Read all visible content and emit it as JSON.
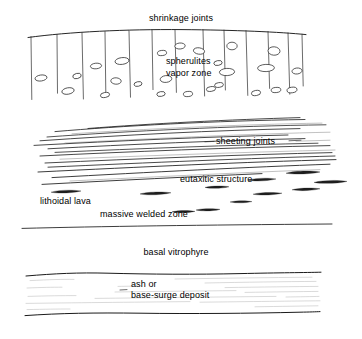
{
  "figure": {
    "title_text": "shrinkage joints",
    "background_color": "#ffffff",
    "ink_color": "#1a1a1a",
    "faint_ink_color": "#8d8d8d",
    "width": 362,
    "height": 339
  },
  "labels": {
    "shrinkage_joints": "shrinkage joints",
    "spherulites": "spherulites",
    "vapor_zone": "vapor zone",
    "sheeting_joints": "sheeting joints",
    "eutaxitic_structure": "eutaxitic structure",
    "lithoidal_lava": "lithoidal lava",
    "massive_welded_zone": "massive welded zone",
    "basal_vitrophyre": "basal vitrophyre",
    "ash_or": "ash or",
    "base_surge_deposit": "base-surge deposit"
  },
  "zones": [
    {
      "name": "shrinkage-joint-zone",
      "label": "shrinkage joints",
      "sub_labels": [
        "spherulites",
        "vapor zone"
      ],
      "feature": "vertical columnar joints with elliptical vesicles"
    },
    {
      "name": "sheeting-joint-zone",
      "label": "sheeting joints",
      "feature": "sub-horizontal sheeting joint traces"
    },
    {
      "name": "eutaxitic-zone",
      "label": "eutaxitic structure",
      "feature": "flattened dark fiamme lenses"
    },
    {
      "name": "massive-welded-zone",
      "label": "massive welded zone",
      "feature": "massive welded tuff"
    },
    {
      "name": "lithoidal-lava-zone",
      "label": "lithoidal lava",
      "feature": "lithoidal devitrified lava"
    },
    {
      "name": "basal-vitrophyre-zone",
      "label": "basal vitrophyre",
      "feature": "glassy basal layer"
    },
    {
      "name": "ash-base-surge-zone",
      "label": "ash or base-surge deposit",
      "feature": "finely laminated ash / base-surge bedding"
    }
  ],
  "geometry": {
    "top_surface": "gentle convex arc from x=28 to x=306",
    "vertical_joints_count": 13,
    "vertical_joint_x": [
      31,
      57,
      82,
      105,
      129,
      152,
      175,
      203,
      224,
      246,
      268,
      288,
      302
    ],
    "vesicle_count": 24,
    "sheeting_line_count": 14,
    "fiamme_count": 11,
    "ash_layer_top_y": 272,
    "ash_layer_bottom_y": 315
  }
}
